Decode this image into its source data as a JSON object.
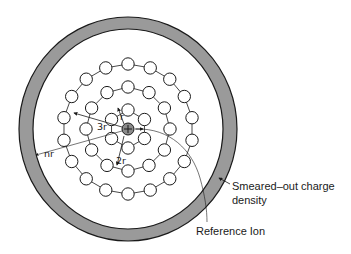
{
  "figure": {
    "colors": {
      "background": "#ffffff",
      "ring_fill": "#9a9a9a",
      "stroke": "#1a1a1a",
      "reference_ion_fill": "#8a8a8a"
    }
  },
  "labels": {
    "smeared_line1": "Smeared–out charge",
    "smeared_line2": "density",
    "reference_ion": "Reference Ion",
    "r": "r",
    "two_r": "2r",
    "three_r": "3r",
    "n_r": "nr"
  },
  "structure": {
    "center": [
      128,
      129
    ],
    "outer_shell": {
      "outer_radius_x": 109,
      "outer_radius_y": 112,
      "inner_radius_x": 95,
      "inner_radius_y": 100
    },
    "reference_ion_radius": 6,
    "rings": [
      {
        "name": "ring-1",
        "radius": 19,
        "count": 6
      },
      {
        "name": "ring-2",
        "radius": 42,
        "count": 12
      },
      {
        "name": "ring-3",
        "radius": 65,
        "count": 18
      }
    ],
    "ion_radius": 6.2
  }
}
